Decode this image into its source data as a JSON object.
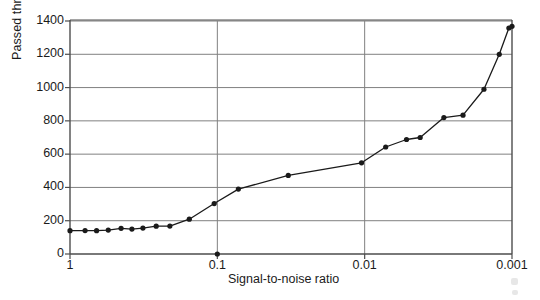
{
  "chart_data": {
    "type": "line",
    "title": "",
    "subtitle": "",
    "xlabel": "Signal-to-noise ratio",
    "ylabel": "Passed through network",
    "xscale": "log-reversed",
    "xlim": [
      1,
      0.001
    ],
    "ylim": [
      0,
      1400
    ],
    "xticks": [
      1,
      0.1,
      0.01,
      0.001
    ],
    "xtick_labels": [
      "1",
      "0.1",
      "0.01",
      "0.001"
    ],
    "yticks": [
      0,
      200,
      400,
      600,
      800,
      1000,
      1200,
      1400
    ],
    "ytick_labels": [
      "0",
      "200",
      "400",
      "600",
      "800",
      "1000",
      "1200",
      "1400"
    ],
    "grid": "horizontal-and-vertical",
    "legend": "none",
    "marker": "filled-circle",
    "line_color": "#1a1a1a",
    "grid_color": "#808080",
    "axis_color": "#4d4d4d",
    "series": [
      {
        "name": "Passed through network",
        "points": [
          {
            "x": 1.0,
            "y": 140
          },
          {
            "x": 0.79,
            "y": 141
          },
          {
            "x": 0.66,
            "y": 140
          },
          {
            "x": 0.55,
            "y": 144
          },
          {
            "x": 0.45,
            "y": 154
          },
          {
            "x": 0.38,
            "y": 150
          },
          {
            "x": 0.32,
            "y": 156
          },
          {
            "x": 0.26,
            "y": 167
          },
          {
            "x": 0.21,
            "y": 168
          },
          {
            "x": 0.155,
            "y": 209
          },
          {
            "x": 0.105,
            "y": 303
          },
          {
            "x": 0.072,
            "y": 390
          },
          {
            "x": 0.033,
            "y": 472
          },
          {
            "x": 0.0105,
            "y": 548
          },
          {
            "x": 0.0072,
            "y": 643
          },
          {
            "x": 0.0052,
            "y": 688
          },
          {
            "x": 0.0042,
            "y": 700
          },
          {
            "x": 0.0029,
            "y": 820
          },
          {
            "x": 0.00215,
            "y": 834
          },
          {
            "x": 0.00155,
            "y": 990
          },
          {
            "x": 0.00122,
            "y": 1200
          },
          {
            "x": 0.00105,
            "y": 1358
          },
          {
            "x": 0.001,
            "y": 1368
          }
        ]
      }
    ],
    "outlier_points": [
      {
        "x": 0.1,
        "y": 0,
        "note": "isolated marker on x-axis at 0.1"
      }
    ]
  }
}
